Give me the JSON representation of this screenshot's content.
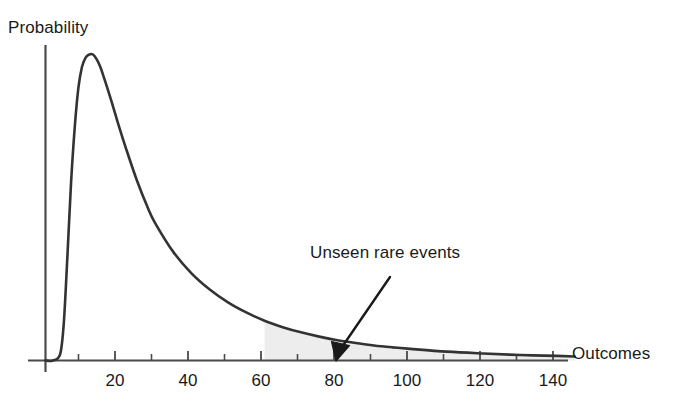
{
  "chart_data": {
    "type": "line",
    "title": "",
    "subtitle": "",
    "xlabel": "Outcomes",
    "ylabel": "Probability",
    "xlim": [
      0,
      145
    ],
    "ylim": [
      0,
      1
    ],
    "grid": false,
    "legend": "none",
    "xticks": [
      20,
      40,
      60,
      80,
      100,
      120,
      140
    ],
    "xtick_labels": [
      "20",
      "40",
      "60",
      "80",
      "100",
      "120",
      "140"
    ],
    "minor_xticks": [
      10,
      30,
      50,
      70,
      90,
      110,
      130
    ],
    "yticks": [],
    "ytick_labels": [],
    "series": [
      {
        "name": "probability density",
        "description": "right-skewed lognormal-like density, peak near x=13",
        "color": "#333333",
        "x": [
          0,
          2,
          4,
          5,
          6,
          7,
          8,
          9,
          10,
          11,
          12,
          13,
          14,
          15,
          16,
          18,
          20,
          22,
          25,
          28,
          30,
          35,
          40,
          45,
          50,
          55,
          60,
          65,
          70,
          75,
          80,
          85,
          90,
          95,
          100,
          110,
          120,
          130,
          140,
          145
        ],
        "y": [
          0.0,
          0.0,
          0.02,
          0.12,
          0.34,
          0.58,
          0.76,
          0.89,
          0.96,
          0.99,
          1.0,
          1.0,
          0.985,
          0.96,
          0.925,
          0.85,
          0.77,
          0.695,
          0.59,
          0.5,
          0.45,
          0.355,
          0.285,
          0.232,
          0.19,
          0.157,
          0.13,
          0.109,
          0.092,
          0.078,
          0.066,
          0.057,
          0.049,
          0.043,
          0.038,
          0.029,
          0.023,
          0.018,
          0.015,
          0.013
        ]
      }
    ],
    "shaded_region": {
      "label": "tail region",
      "x_start": 60,
      "x_end": 145,
      "fill_color": "#ededed"
    },
    "annotations": [
      {
        "text": "Unseen rare events",
        "text_x": 80,
        "text_y": 0.52,
        "arrow_points_to_x": 80,
        "arrow_points_to_y": 0.02
      }
    ]
  },
  "axis": {
    "y_axis_label": "Probability",
    "x_axis_label": "Outcomes"
  },
  "ticks": {
    "labels": [
      "20",
      "40",
      "60",
      "80",
      "100",
      "120",
      "140"
    ]
  },
  "annotation": {
    "label": "Unseen rare events"
  },
  "colors": {
    "curve": "#333333",
    "axis": "#4a4a4a",
    "shade": "#ededed",
    "text": "#1a1a1a",
    "background": "#ffffff"
  }
}
